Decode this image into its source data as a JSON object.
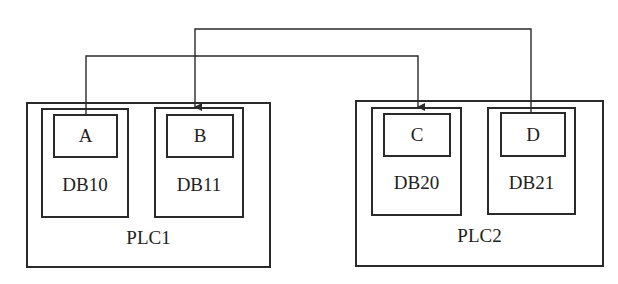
{
  "diagram": {
    "plcs": [
      {
        "name": "PLC1",
        "data_blocks": [
          {
            "name": "DB10",
            "variable": "A"
          },
          {
            "name": "DB11",
            "variable": "B"
          }
        ]
      },
      {
        "name": "PLC2",
        "data_blocks": [
          {
            "name": "DB20",
            "variable": "C"
          },
          {
            "name": "DB21",
            "variable": "D"
          }
        ]
      }
    ],
    "connections": [
      {
        "from": "A",
        "to": "C"
      },
      {
        "from": "D",
        "to": "B"
      }
    ],
    "line_color": "#2a2a2a"
  }
}
